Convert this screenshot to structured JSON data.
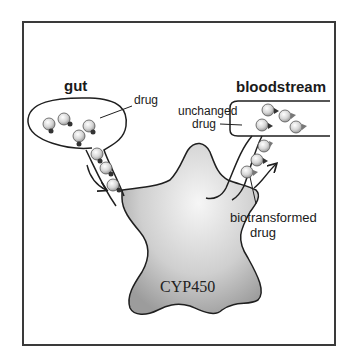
{
  "diagram": {
    "type": "process-schematic",
    "compartments": {
      "gut": {
        "label": "gut"
      },
      "bloodstream": {
        "label": "bloodstream"
      }
    },
    "enzyme": {
      "label": "CYP450"
    },
    "annotations": {
      "drug": "drug",
      "unchanged_line1": "unchanged",
      "unchanged_line2": "drug",
      "biotransformed_line1": "biotransformed",
      "biotransformed_line2": "drug"
    },
    "colors": {
      "frame": "#3a3a3a",
      "outline": "#1f1f1f",
      "enzyme_center": "#f4f4f4",
      "enzyme_edge": "#9a9a9a",
      "molecule": "#d9d9d9",
      "drug_tag": "#333333",
      "metabolite_tag": "#777777"
    },
    "flow": [
      "gut",
      "CYP450",
      "bloodstream"
    ]
  }
}
